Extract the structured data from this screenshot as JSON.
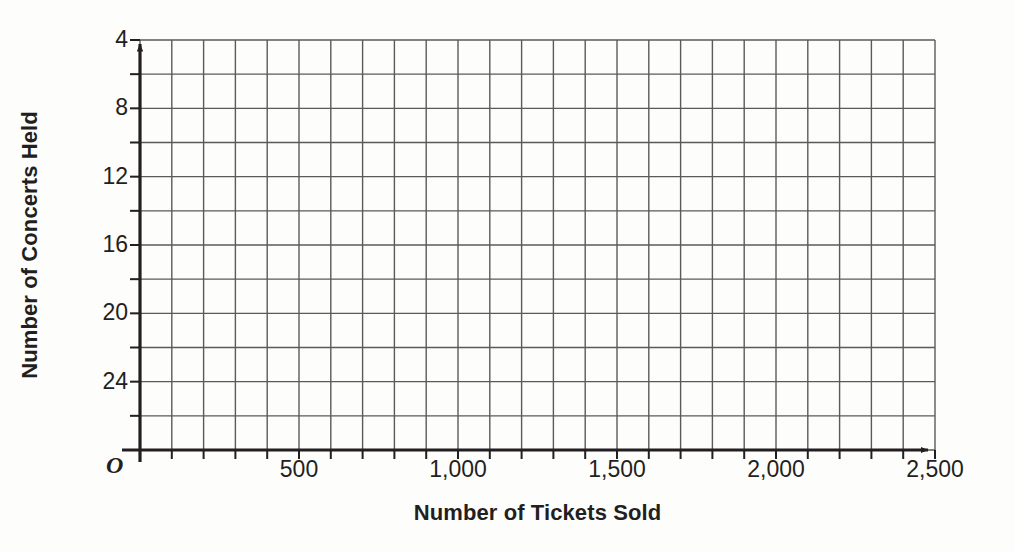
{
  "chart_data": {
    "type": "scatter",
    "title": "",
    "subtitle": "",
    "xlabel": "Number of Tickets Sold",
    "ylabel": "Number of Concerts Held",
    "xlim": [
      0,
      2500
    ],
    "ylim": [
      0,
      24
    ],
    "grid": true,
    "legend": null,
    "series": [],
    "values": [],
    "x": [],
    "annotations": [],
    "origin_label": "O",
    "x_major_ticks": [
      500,
      1000,
      1500,
      2000,
      2500
    ],
    "x_tick_labels": [
      "500",
      "1,000",
      "1,500",
      "2,000",
      "2,500"
    ],
    "x_minor_step": 100,
    "y_major_ticks": [
      4,
      8,
      12,
      16,
      20,
      24
    ],
    "y_tick_labels": [
      "4",
      "8",
      "12",
      "16",
      "20",
      "24"
    ],
    "y_minor_step": 2,
    "x_gridline_count": 25,
    "y_gridline_count": 12,
    "note": "Empty coordinate grid with no plotted data points"
  },
  "axes": {
    "y_title": "Number of Concerts Held",
    "x_title": "Number of Tickets Sold",
    "origin": "O",
    "y_ticks": [
      {
        "label": "24",
        "value": 24
      },
      {
        "label": "20",
        "value": 20
      },
      {
        "label": "16",
        "value": 16
      },
      {
        "label": "12",
        "value": 12
      },
      {
        "label": "8",
        "value": 8
      },
      {
        "label": "4",
        "value": 4
      }
    ],
    "x_ticks": [
      {
        "label": "500",
        "value": 500
      },
      {
        "label": "1,000",
        "value": 1000
      },
      {
        "label": "1,500",
        "value": 1500
      },
      {
        "label": "2,000",
        "value": 2000
      },
      {
        "label": "2,500",
        "value": 2500
      }
    ]
  },
  "colors": {
    "background": "#fdfdfc",
    "axis": "#231f20",
    "gridline": "#5a5a5a",
    "text": "#231f20"
  }
}
